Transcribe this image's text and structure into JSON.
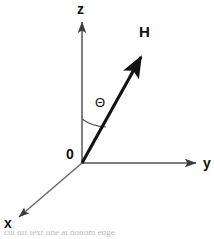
{
  "figure": {
    "background_color": "#ffffff",
    "stroke_color": "#4a4a4a",
    "vector_color": "#111111",
    "width": 214,
    "height": 239
  },
  "labels": {
    "z_axis": "z",
    "y_axis": "y",
    "x_axis": "x",
    "vector": "H",
    "origin": "0",
    "angle": "Θ"
  },
  "geometry": {
    "origin": {
      "x": 82,
      "y": 163
    },
    "z_axis_tip": {
      "x": 82,
      "y": 18
    },
    "y_axis_tip": {
      "x": 201,
      "y": 163
    },
    "x_axis_tip": {
      "x": 14,
      "y": 221
    },
    "vector_tip": {
      "x": 147,
      "y": 50
    },
    "angle_arc_radius": 44,
    "angle_degrees": 30
  },
  "caption": {
    "text": "cut off text line at bottom edge"
  }
}
